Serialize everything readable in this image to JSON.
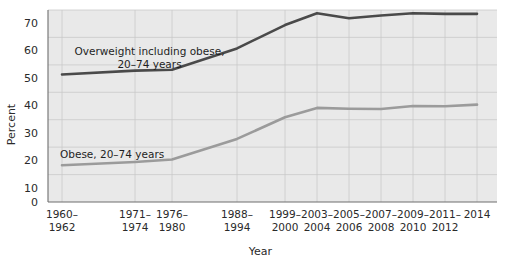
{
  "chart_data": {
    "type": "line",
    "title": "",
    "xlabel": "Year",
    "ylabel": "Percent",
    "ylim": [
      0,
      70
    ],
    "yticks": [
      0,
      10,
      20,
      30,
      40,
      50,
      60,
      70
    ],
    "grid": true,
    "legend_position": "inline-annotations",
    "categories": [
      "1960–\n1962",
      "1971–\n1974",
      "1976–\n1980",
      "1988–\n1994",
      "1999–\n2000",
      "2003–\n2004",
      "2005–\n2006",
      "2007–\n2008",
      "2009–\n2010",
      "2011–\n2012",
      "2014"
    ],
    "series": [
      {
        "name": "Overweight including obese, 20–74 years",
        "color": "#4a4a4a",
        "values": [
          46.5,
          47.9,
          48.2,
          56.0,
          64.5,
          68.8,
          67.0,
          68.0,
          68.8,
          68.6,
          68.6
        ]
      },
      {
        "name": "Obese, 20–74 years",
        "color": "#9b9b9b",
        "values": [
          13.4,
          14.6,
          15.5,
          23.0,
          30.9,
          34.3,
          34.0,
          33.9,
          35.0,
          34.9,
          35.5
        ]
      }
    ],
    "annotations": [
      {
        "id": "overweight",
        "text": "Overweight including obese,\n20–74 years"
      },
      {
        "id": "obese",
        "text": "Obese, 20–74 years"
      }
    ]
  },
  "axis": {
    "y_tick_labels": [
      "70",
      "60",
      "50",
      "40",
      "30",
      "20",
      "10",
      "0"
    ],
    "x_tick_labels": [
      "1960–\n1962",
      "1971–\n1974",
      "1976–\n1980",
      "1988–\n1994",
      "1999–\n2000",
      "2003–\n2004",
      "2005–\n2006",
      "2007–\n2008",
      "2009–\n2010",
      "2011–\n2012",
      "2014"
    ],
    "y_axis_title": "Percent",
    "x_axis_title": "Year"
  }
}
